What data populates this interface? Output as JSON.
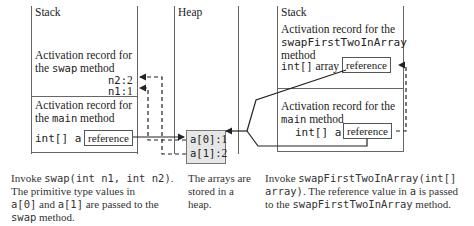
{
  "left_panel": {
    "stack_label": "Stack",
    "swap_record": {
      "line1": "Activation record for",
      "line2_prefix": "the ",
      "line2_code": "swap",
      "line2_suffix": " method",
      "n2": "n2:",
      "n2_value": "2",
      "n1": "n1:",
      "n1_value": "1"
    },
    "main_record": {
      "line1": "Activation record for",
      "line2_prefix": "the ",
      "line2_code": "main",
      "line2_suffix": " method",
      "var_label": "int[] a",
      "ref_label": "reference"
    }
  },
  "heap_panel": {
    "heap_label": "Heap",
    "cells": [
      {
        "label": "a[0]:",
        "value": "1"
      },
      {
        "label": "a[1]:",
        "value": "2"
      }
    ]
  },
  "right_panel": {
    "stack_label": "Stack",
    "swapFirst_record": {
      "line1": "Activation record for the",
      "line2_code": "swapFirstTwoInArray",
      "line3": "method",
      "var_code": "int[]",
      "var_text": " array",
      "ref_label": "reference"
    },
    "main_record": {
      "line1": "Activation record for the",
      "line2_code": "main",
      "line2_suffix": " method",
      "var_label": "int[] a",
      "ref_label": "reference"
    }
  },
  "captions": {
    "left": {
      "p1": "Invoke ",
      "c1": "swap(int n1, int n2)",
      "p2": ".",
      "p3": "The primitive type values in",
      "c2": "a[0]",
      "p4": " and ",
      "c3": "a[1]",
      "p5": " are passed to the",
      "c4": "swap",
      "p6": " method."
    },
    "middle": {
      "line1": "The arrays are",
      "line2": "stored in a",
      "line3": "heap."
    },
    "right": {
      "p1": "Invoke ",
      "c1": "swapFirstTwoInArray(int[]",
      "c2": "array)",
      "p2": ". The reference value in ",
      "c3": "a",
      "p3": " is passed",
      "p4": "to the ",
      "c4": "swapFirstTwoInArray",
      "p5": " method."
    }
  }
}
